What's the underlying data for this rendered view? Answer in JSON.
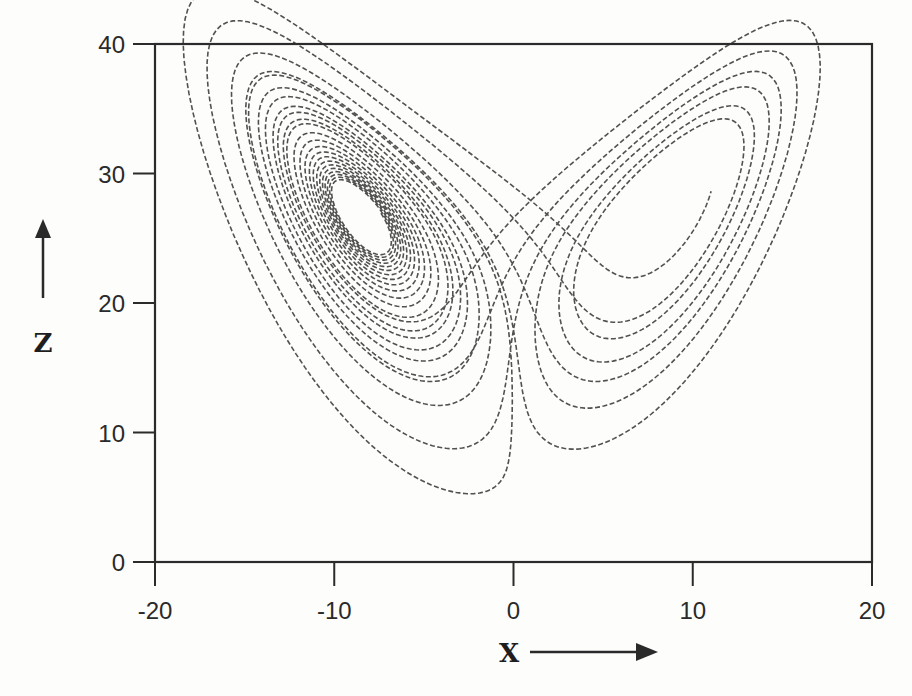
{
  "chart_data": {
    "type": "line",
    "title": "",
    "subtitle": "",
    "xlabel": "X",
    "ylabel": "Z",
    "xlim": [
      -20,
      20
    ],
    "ylim": [
      0,
      40
    ],
    "xticks": [
      -20,
      -10,
      0,
      10,
      20
    ],
    "yticks": [
      0,
      10,
      20,
      30,
      40
    ],
    "xtick_labels": [
      "-20",
      "-10",
      "0",
      "10",
      "20"
    ],
    "ytick_labels": [
      "0",
      "10",
      "20",
      "30",
      "40"
    ],
    "grid": false,
    "legend": null,
    "x_axis_arrow": "right",
    "y_axis_arrow": "up",
    "series": [
      {
        "name": "Lorenz trajectory",
        "style": "dashed",
        "system": {
          "sigma": 10,
          "rho": 28,
          "beta": 2.6667
        },
        "initial": {
          "x": 1.0,
          "y": 1.0,
          "z": 1.0
        },
        "dt": 0.005,
        "skip_steps": 600,
        "steps": 4200,
        "features": {
          "left_lobe_center": [
            -8.5,
            27
          ],
          "right_lobe_center": [
            8.5,
            27
          ],
          "left_lobe_x_range": [
            -17,
            -3
          ],
          "right_lobe_x_range": [
            3,
            18
          ],
          "z_range": [
            5,
            35
          ],
          "crossing_point": [
            0,
            21
          ]
        }
      }
    ]
  },
  "plot": {
    "frame_px": {
      "left": 155,
      "right": 872,
      "top": 44,
      "bottom": 562
    },
    "colors": {
      "ink": "#2b2b2b",
      "paper": "#fdfdfb",
      "curve": "#333333"
    }
  },
  "labels": {
    "x_axis_name": "X",
    "z_axis_name": "Z"
  }
}
